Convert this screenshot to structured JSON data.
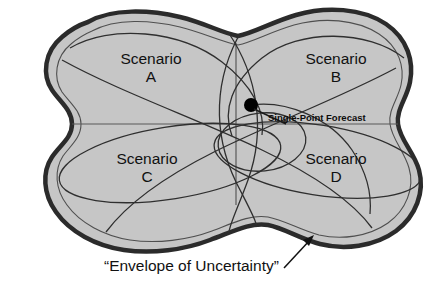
{
  "diagram": {
    "title": "Envelope of Uncertainty",
    "caption": "“Envelope of Uncertainty”",
    "single_point_forecast_label": "Single-Point Forecast",
    "scenarios": [
      {
        "id": "a",
        "name": "Scenario",
        "letter": "A"
      },
      {
        "id": "b",
        "name": "Scenario",
        "letter": "B"
      },
      {
        "id": "c",
        "name": "Scenario",
        "letter": "C"
      },
      {
        "id": "d",
        "name": "Scenario",
        "letter": "D"
      }
    ],
    "colors": {
      "background": "#ffffff",
      "envelope_fill": "#c6c6c6",
      "envelope_stroke": "#2b2b2b",
      "inner_curve_stroke": "#2f2f2f",
      "axis_stroke": "#4a4a4a",
      "forecast_dot": "#000000",
      "text": "#111111"
    },
    "geometry": {
      "canvas_width": 448,
      "canvas_height": 287,
      "forecast_dot": {
        "x": 251,
        "y": 105,
        "r": 7
      },
      "vertical_axis": {
        "x": 236,
        "y1": 43,
        "y2": 205
      },
      "horizontal_axis": {
        "y": 124,
        "x1": 55,
        "x2": 415
      },
      "arrow": {
        "x1": 284,
        "y1": 268,
        "x2": 313,
        "y2": 237
      }
    }
  }
}
